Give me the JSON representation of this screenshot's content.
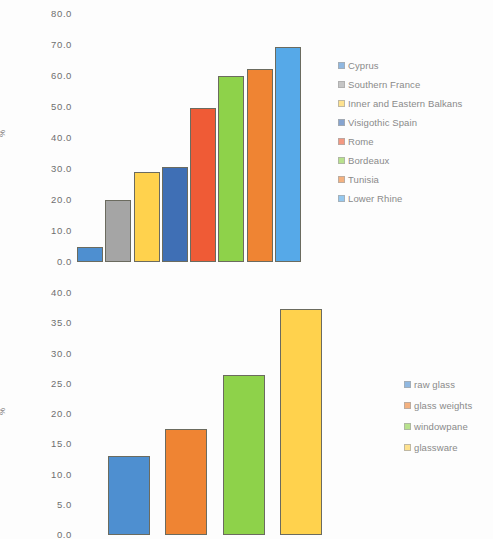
{
  "chart_data": [
    {
      "type": "bar",
      "id": "top-chart",
      "title": "",
      "xlabel": "",
      "ylabel": "%",
      "ylim": [
        0,
        80
      ],
      "ytick_step": 10,
      "ytick_labels": [
        "80.0",
        "70.0",
        "60.0",
        "50.0",
        "40.0",
        "30.0",
        "20.0",
        "10.0",
        "0.0"
      ],
      "grid": false,
      "legend_position": "right",
      "categories": [
        "Cyprus",
        "Southern France",
        "Inner and Eastern Balkans",
        "Visigothic Spain",
        "Rome",
        "Bordeaux",
        "Tunisia",
        "Lower Rhine"
      ],
      "values": [
        5.0,
        20.0,
        29.0,
        30.8,
        49.7,
        60.0,
        62.3,
        69.5
      ],
      "colors": [
        "#4e8fd0",
        "#a5a5a5",
        "#ffd24d",
        "#3f6fb5",
        "#ef5b36",
        "#8ed martingale",
        "#ef8433",
        "#56a9e8"
      ]
    },
    {
      "type": "bar",
      "id": "bottom-chart",
      "title": "",
      "xlabel": "",
      "ylabel": "%",
      "ylim": [
        0,
        40
      ],
      "ytick_step": 5,
      "ytick_labels": [
        "40.0",
        "35.0",
        "30.0",
        "25.0",
        "20.0",
        "15.0",
        "10.0",
        "5.0",
        "0.0"
      ],
      "grid": false,
      "legend_position": "right",
      "categories": [
        "raw glass",
        "glass weights",
        "windowpane",
        "glassware"
      ],
      "values": [
        13.0,
        17.5,
        26.5,
        37.3
      ],
      "colors": [
        "#4e8fd0",
        "#ef8433",
        "#8ed24a",
        "#ffd24d"
      ]
    }
  ],
  "top": {
    "ylabel": "%",
    "ticks": [
      "80.0",
      "70.0",
      "60.0",
      "50.0",
      "40.0",
      "30.0",
      "20.0",
      "10.0",
      "0.0"
    ],
    "bars": [
      {
        "label": "Cyprus",
        "value": 5.0,
        "color": "#4e8fd0"
      },
      {
        "label": "Southern France",
        "value": 20.0,
        "color": "#a5a5a5"
      },
      {
        "label": "Inner and Eastern Balkans",
        "value": 29.0,
        "color": "#ffd24d"
      },
      {
        "label": "Visigothic Spain",
        "value": 30.8,
        "color": "#3f6fb5"
      },
      {
        "label": "Rome",
        "value": 49.7,
        "color": "#ef5b36"
      },
      {
        "label": "Bordeaux",
        "value": 60.0,
        "color": "#8ed24a"
      },
      {
        "label": "Tunisia",
        "value": 62.3,
        "color": "#ef8433"
      },
      {
        "label": "Lower Rhine",
        "value": 69.5,
        "color": "#56a9e8"
      }
    ],
    "legend": [
      {
        "label": "Cyprus",
        "color": "#4e8fd0"
      },
      {
        "label": "Southern France",
        "color": "#a5a5a5"
      },
      {
        "label": "Inner and Eastern Balkans",
        "color": "#ffd24d"
      },
      {
        "label": "Visigothic Spain",
        "color": "#3f6fb5"
      },
      {
        "label": "Rome",
        "color": "#ef5b36"
      },
      {
        "label": "Bordeaux",
        "color": "#8ed24a"
      },
      {
        "label": "Tunisia",
        "color": "#ef8433"
      },
      {
        "label": "Lower Rhine",
        "color": "#56a9e8"
      }
    ]
  },
  "bottom": {
    "ylabel": "%",
    "ticks": [
      "40.0",
      "35.0",
      "30.0",
      "25.0",
      "20.0",
      "15.0",
      "10.0",
      "5.0",
      "0.0"
    ],
    "bars": [
      {
        "label": "raw glass",
        "value": 13.0,
        "color": "#4e8fd0"
      },
      {
        "label": "glass weights",
        "value": 17.5,
        "color": "#ef8433"
      },
      {
        "label": "windowpane",
        "value": 26.5,
        "color": "#8ed24a"
      },
      {
        "label": "glassware",
        "value": 37.3,
        "color": "#ffd24d"
      }
    ],
    "legend": [
      {
        "label": "raw glass",
        "color": "#4e8fd0"
      },
      {
        "label": "glass weights",
        "color": "#ef8433"
      },
      {
        "label": "windowpane",
        "color": "#8ed24a"
      },
      {
        "label": "glassware",
        "color": "#ffd24d"
      }
    ]
  }
}
